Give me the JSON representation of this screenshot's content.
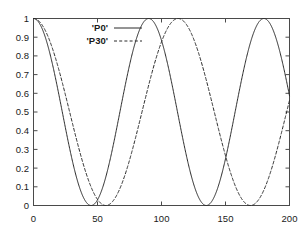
{
  "chart_data": {
    "type": "line",
    "title": "",
    "xlabel": "",
    "ylabel": "",
    "xlim": [
      0,
      200
    ],
    "ylim": [
      0,
      1
    ],
    "xticks": [
      0,
      50,
      100,
      150,
      200
    ],
    "yticks": [
      0,
      0.1,
      0.2,
      0.3,
      0.4,
      0.5,
      0.6,
      0.7,
      0.8,
      0.9,
      1
    ],
    "xtick_labels": [
      "0",
      "50",
      "100",
      "150",
      "200"
    ],
    "ytick_labels": [
      "0",
      "0.1",
      "0.2",
      "0.3",
      "0.4",
      "0.5",
      "0.6",
      "0.7",
      "0.8",
      "0.9",
      "1"
    ],
    "grid": false,
    "legend_position": "top-left-inside",
    "series": [
      {
        "name": "'P0'",
        "linestyle": "solid",
        "color": "#2b2b2b",
        "period": 90,
        "description": "cos^2 oscillation, maxima at x=0,90,180; minima near x=45,135",
        "x": [
          0,
          5,
          10,
          15,
          20,
          25,
          30,
          35,
          40,
          45,
          50,
          55,
          60,
          65,
          70,
          75,
          80,
          85,
          90,
          95,
          100,
          105,
          110,
          115,
          120,
          125,
          130,
          135,
          140,
          145,
          150,
          155,
          160,
          165,
          170,
          175,
          180,
          185,
          190,
          195,
          200
        ],
        "values": [
          1.0,
          0.97,
          0.883,
          0.75,
          0.587,
          0.413,
          0.25,
          0.117,
          0.03,
          0.0,
          0.03,
          0.117,
          0.25,
          0.413,
          0.587,
          0.75,
          0.883,
          0.97,
          1.0,
          0.97,
          0.883,
          0.75,
          0.587,
          0.413,
          0.25,
          0.117,
          0.03,
          0.0,
          0.03,
          0.117,
          0.25,
          0.413,
          0.587,
          0.75,
          0.883,
          0.97,
          1.0,
          0.97,
          0.883,
          0.75,
          0.587
        ]
      },
      {
        "name": "'P30'",
        "linestyle": "dashed",
        "color": "#2b2b2b",
        "period": 113,
        "description": "cos^2 oscillation, maxima at x=0,113; minima near x=56.5,169.5",
        "x": [
          0,
          5,
          10,
          15,
          20,
          25,
          30,
          35,
          40,
          45,
          50,
          55,
          60,
          65,
          70,
          75,
          80,
          85,
          90,
          95,
          100,
          105,
          110,
          115,
          120,
          125,
          130,
          135,
          140,
          145,
          150,
          155,
          160,
          165,
          170,
          175,
          180,
          185,
          190,
          195,
          200
        ],
        "values": [
          1.0,
          0.981,
          0.924,
          0.835,
          0.72,
          0.589,
          0.452,
          0.319,
          0.2,
          0.104,
          0.036,
          0.002,
          0.002,
          0.036,
          0.104,
          0.2,
          0.319,
          0.452,
          0.589,
          0.72,
          0.835,
          0.924,
          0.981,
          1.0,
          0.981,
          0.924,
          0.835,
          0.72,
          0.589,
          0.452,
          0.319,
          0.2,
          0.104,
          0.036,
          0.002,
          0.002,
          0.036,
          0.104,
          0.2,
          0.319,
          0.452
        ]
      }
    ]
  },
  "legend": {
    "entries": [
      {
        "label": "'P0'",
        "style": "solid-line-sample"
      },
      {
        "label": "'P30'",
        "style": "dashed-line-sample"
      }
    ]
  }
}
